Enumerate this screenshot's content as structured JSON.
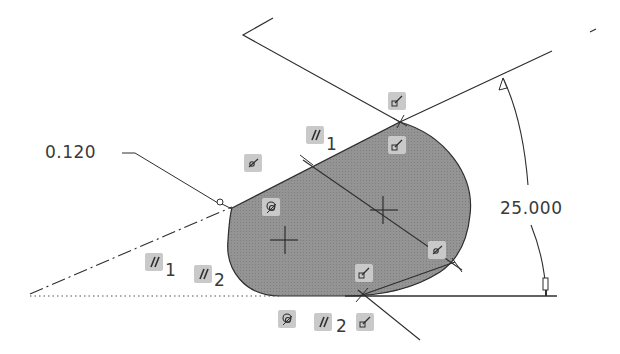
{
  "sketch": {
    "dimensions": [
      {
        "id": "offset",
        "value": "0.120"
      },
      {
        "id": "angle",
        "value": "25.000"
      }
    ],
    "constraints": [
      {
        "type": "parallel",
        "index": "1",
        "position": "upper-edge"
      },
      {
        "type": "parallel",
        "index": "1",
        "position": "lower-left"
      },
      {
        "type": "parallel",
        "index": "2",
        "position": "lower-left"
      },
      {
        "type": "parallel",
        "index": "2",
        "position": "bottom"
      },
      {
        "type": "tangent",
        "position": "top-vertex-above"
      },
      {
        "type": "tangent",
        "position": "top-vertex-below"
      },
      {
        "type": "tangent",
        "position": "bottom-vertex-above"
      },
      {
        "type": "tangent",
        "position": "bottom-vertex-right"
      },
      {
        "type": "point-on-curve",
        "position": "upper-left"
      },
      {
        "type": "point-on-curve",
        "position": "lower-right"
      },
      {
        "type": "concentric",
        "position": "left-arc"
      },
      {
        "type": "concentric",
        "position": "bottom"
      }
    ],
    "colors": {
      "fill": "#8e8e8e",
      "line": "#2e2e2e",
      "constraint_bg": "#c9c9c9",
      "text": "#3a3a3a"
    }
  }
}
